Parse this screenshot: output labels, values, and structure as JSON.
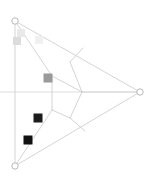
{
  "figure": {
    "title": "Triangular mesh graph with node markers",
    "width": 153,
    "height": 180,
    "background": "#ffffff"
  },
  "style": {
    "edge_color": "#c9c9c9",
    "edge_color_faint": "#dcdcdc",
    "edge_width": 0.8,
    "node_stroke": "#b0b0b0",
    "node_fill": "#ffffff",
    "node_radius": 3.2,
    "node_stroke_width": 0.9
  },
  "nodes": [
    {
      "id": "n-top-left",
      "label": "top-left vertex",
      "x": 15,
      "y": 21,
      "shape": "circle"
    },
    {
      "id": "n-bottom-left",
      "label": "bottom-left vertex",
      "x": 15,
      "y": 166,
      "shape": "circle"
    },
    {
      "id": "n-right",
      "label": "right vertex",
      "x": 140,
      "y": 92,
      "shape": "circle"
    }
  ],
  "edges": [
    {
      "id": "e-left-spine",
      "label": "left vertical edge",
      "x1": 15,
      "y1": 21,
      "x2": 15,
      "y2": 166,
      "color": "#c9c9c9",
      "width": 0.8
    },
    {
      "id": "e-top-to-right",
      "label": "top-left to right edge",
      "x1": 15,
      "y1": 21,
      "x2": 140,
      "y2": 92,
      "color": "#c9c9c9",
      "width": 0.8
    },
    {
      "id": "e-bottom-to-right",
      "label": "bottom-left to right edge",
      "x1": 15,
      "y1": 166,
      "x2": 140,
      "y2": 92,
      "color": "#c9c9c9",
      "width": 0.8
    },
    {
      "id": "e-horizontal-mid",
      "label": "horizontal midline",
      "x1": 0,
      "y1": 92,
      "x2": 140,
      "y2": 92,
      "color": "#d4d4d4",
      "width": 0.8
    },
    {
      "id": "e-top-to-core",
      "label": "top-left to core node",
      "x1": 15,
      "y1": 21,
      "x2": 52,
      "y2": 76,
      "color": "#c9c9c9",
      "width": 0.8
    },
    {
      "id": "e-core-spine",
      "label": "core vertical segment",
      "x1": 52,
      "y1": 76,
      "x2": 52,
      "y2": 110,
      "color": "#c9c9c9",
      "width": 0.8
    },
    {
      "id": "e-core-to-hub",
      "label": "core to hub edge",
      "x1": 52,
      "y1": 76,
      "x2": 82,
      "y2": 92,
      "color": "#c9c9c9",
      "width": 0.8
    },
    {
      "id": "e-hub-to-right",
      "label": "hub to right vertex",
      "x1": 82,
      "y1": 92,
      "x2": 140,
      "y2": 92,
      "color": "#d0d0d0",
      "width": 0.8
    },
    {
      "id": "e-hub-upper",
      "label": "hub to upper brace",
      "x1": 82,
      "y1": 92,
      "x2": 70,
      "y2": 62,
      "color": "#c9c9c9",
      "width": 0.8
    },
    {
      "id": "e-brace-upper",
      "label": "upper brace to top edge",
      "x1": 70,
      "y1": 62,
      "x2": 83,
      "y2": 48,
      "color": "#c9c9c9",
      "width": 0.8
    },
    {
      "id": "e-hub-lower",
      "label": "hub to lower brace",
      "x1": 82,
      "y1": 92,
      "x2": 70,
      "y2": 118,
      "color": "#c9c9c9",
      "width": 0.8
    },
    {
      "id": "e-brace-lower",
      "label": "lower brace to bottom edge",
      "x1": 70,
      "y1": 118,
      "x2": 85,
      "y2": 131,
      "color": "#c9c9c9",
      "width": 0.8
    },
    {
      "id": "e-core-to-lower",
      "label": "core down to lower brace",
      "x1": 52,
      "y1": 110,
      "x2": 70,
      "y2": 118,
      "color": "#c9c9c9",
      "width": 0.8
    },
    {
      "id": "e-core-to-bottom",
      "label": "core to bottom-left edge",
      "x1": 52,
      "y1": 110,
      "x2": 15,
      "y2": 166,
      "color": "#c9c9c9",
      "width": 0.8
    }
  ],
  "markers": [
    {
      "id": "m-faint-upper",
      "label": "faint marker upper",
      "x": 21,
      "y": 33,
      "size": 8,
      "color": "#e9e9e9"
    },
    {
      "id": "m-light-left",
      "label": "light marker left",
      "x": 17,
      "y": 41,
      "size": 8,
      "color": "#dcdcdc"
    },
    {
      "id": "m-faint-right",
      "label": "faint marker right",
      "x": 39,
      "y": 40,
      "size": 8,
      "color": "#f0f0f0"
    },
    {
      "id": "m-mid-gray",
      "label": "mid gray marker",
      "x": 48,
      "y": 78,
      "size": 9,
      "color": "#9a9a9a"
    },
    {
      "id": "m-dark-upper",
      "label": "dark marker upper",
      "x": 38,
      "y": 118,
      "size": 9,
      "color": "#1c1c1c"
    },
    {
      "id": "m-dark-lower",
      "label": "dark marker lower",
      "x": 28,
      "y": 140,
      "size": 9,
      "color": "#111111"
    }
  ],
  "legend": {
    "visible": false,
    "entries": []
  },
  "chart_data": {
    "type": "scatter",
    "title": "Triangular mesh graph with node markers",
    "xlabel": "",
    "ylabel": "",
    "xlim": [
      0,
      153
    ],
    "ylim": [
      0,
      180
    ],
    "grid": false,
    "series": [
      {
        "name": "vertices",
        "marker": "open-circle",
        "values": [
          {
            "x": 15,
            "y": 21
          },
          {
            "x": 15,
            "y": 166
          },
          {
            "x": 140,
            "y": 92
          }
        ]
      },
      {
        "name": "square-markers",
        "marker": "filled-square",
        "values": [
          {
            "x": 21,
            "y": 33,
            "shade": "#e9e9e9"
          },
          {
            "x": 17,
            "y": 41,
            "shade": "#dcdcdc"
          },
          {
            "x": 39,
            "y": 40,
            "shade": "#f0f0f0"
          },
          {
            "x": 48,
            "y": 78,
            "shade": "#9a9a9a"
          },
          {
            "x": 38,
            "y": 118,
            "shade": "#1c1c1c"
          },
          {
            "x": 28,
            "y": 140,
            "shade": "#111111"
          }
        ]
      }
    ]
  }
}
